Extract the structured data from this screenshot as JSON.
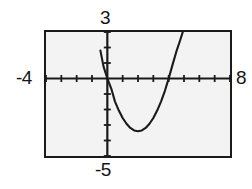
{
  "figure": {
    "name": "graphing-calculator-parabola-window",
    "background_color": "#ffffff",
    "plot_background_color": "#f3f3f3",
    "frame_color": "#1a1a1a",
    "curve_color": "#1a1a1a"
  },
  "labels": {
    "xmin": "-4",
    "xmax": "8",
    "ymax": "3",
    "ymin": "-5"
  },
  "chart_data": {
    "type": "line",
    "title": "",
    "xlabel": "",
    "ylabel": "",
    "xlim": [
      -4,
      8
    ],
    "ylim": [
      -5,
      3
    ],
    "grid": false,
    "legend": false,
    "xticks": [
      -4,
      -3,
      -2,
      -1,
      0,
      1,
      2,
      3,
      4,
      5,
      6,
      7,
      8
    ],
    "yticks": [
      -5,
      -4,
      -3,
      -2,
      -1,
      0,
      1,
      2,
      3
    ],
    "xtick_labels": [
      "-4",
      "",
      "",
      "",
      "",
      "",
      "",
      "",
      "",
      "",
      "",
      "",
      "8"
    ],
    "ytick_labels": [
      "-5",
      "",
      "",
      "",
      "",
      "",
      "",
      "",
      "3"
    ],
    "series": [
      {
        "name": "parabola",
        "equation": "y = 0.85(x - 2)^2 - 3.4",
        "vertex": [
          2.0,
          -3.4
        ],
        "roots": [
          0.0,
          4.0
        ],
        "x": [
          -0.45,
          -0.25,
          0.0,
          0.25,
          0.5,
          0.75,
          1.0,
          1.25,
          1.5,
          1.75,
          2.0,
          2.25,
          2.5,
          2.75,
          3.0,
          3.25,
          3.5,
          3.75,
          4.0,
          4.25,
          4.5,
          4.75,
          5.0,
          5.2
        ],
        "y": [
          1.8,
          0.78,
          -0.0,
          -0.63,
          -1.49,
          -2.07,
          -2.55,
          -2.92,
          -3.19,
          -3.35,
          -3.4,
          -3.35,
          -3.19,
          -2.92,
          -2.55,
          -2.07,
          -1.49,
          -0.81,
          -0.0,
          0.88,
          1.73,
          2.47,
          3.25,
          3.8
        ]
      }
    ]
  }
}
